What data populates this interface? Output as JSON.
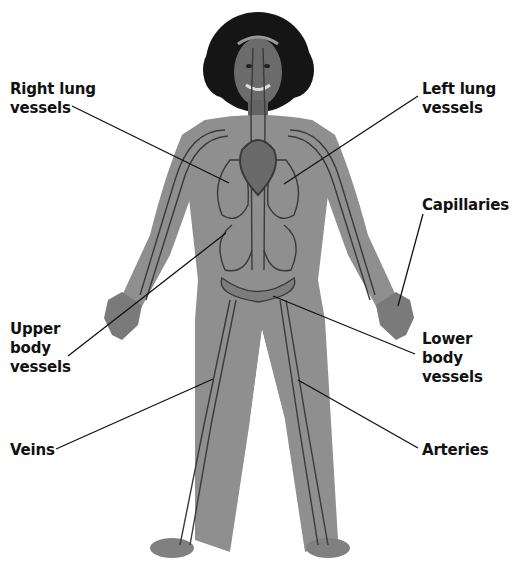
{
  "figure": {
    "colors": {
      "clothing": "#8f8f8f",
      "clothing_shade": "#7d7d7d",
      "vessel": "#3a3a3a",
      "hair": "#151515",
      "skin": "#6b6b6b",
      "leader_line": "#111111",
      "text": "#111111"
    }
  },
  "labels": [
    {
      "id": "right-lung-vessels",
      "text": "Right lung\nvessels",
      "x": 10,
      "y": 80
    },
    {
      "id": "left-lung-vessels",
      "text": "Left lung\nvessels",
      "x": 422,
      "y": 80
    },
    {
      "id": "capillaries",
      "text": "Capillaries",
      "x": 422,
      "y": 196
    },
    {
      "id": "upper-body-vessels",
      "text": "Upper\nbody\nvessels",
      "x": 10,
      "y": 320
    },
    {
      "id": "lower-body-vessels",
      "text": "Lower\nbody\nvessels",
      "x": 422,
      "y": 330
    },
    {
      "id": "veins",
      "text": "Veins",
      "x": 10,
      "y": 441
    },
    {
      "id": "arteries",
      "text": "Arteries",
      "x": 422,
      "y": 441
    }
  ]
}
